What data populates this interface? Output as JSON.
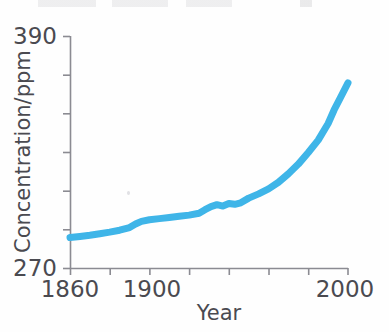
{
  "figure": {
    "background_color": "#fefefe",
    "axis_color": "#8b8b92",
    "text_color": "#4a4a50",
    "top_caption_cut_off": ""
  },
  "axes": {
    "y": {
      "title": "Concentration/ppm",
      "min_label": "270",
      "max_label": "390"
    },
    "x": {
      "title": "Year",
      "start_label": "1860",
      "mid_label": "1900",
      "end_label": "2000"
    }
  },
  "chart_data": {
    "type": "line",
    "title": "",
    "xlabel": "Year",
    "ylabel": "Concentration/ppm",
    "xlim": [
      1860,
      2000
    ],
    "ylim": [
      270,
      390
    ],
    "grid": false,
    "legend": null,
    "line_color": "#3fb5e8",
    "line_width_px": 7,
    "x_ticks": [
      1860,
      1880,
      1900,
      1920,
      1940,
      1960,
      1980,
      2000
    ],
    "x_tick_labels": [
      "1860",
      "",
      "1900",
      "",
      "",
      "",
      "",
      "2000"
    ],
    "y_ticks": [
      270,
      290,
      310,
      330,
      350,
      370,
      390
    ],
    "y_tick_labels": [
      "270",
      "",
      "",
      "",
      "",
      "",
      "390"
    ],
    "series": [
      {
        "name": "Atmospheric CO2 concentration",
        "x": [
          1860,
          1865,
          1870,
          1875,
          1880,
          1885,
          1890,
          1893,
          1896,
          1900,
          1905,
          1910,
          1915,
          1920,
          1925,
          1928,
          1931,
          1934,
          1937,
          1940,
          1943,
          1946,
          1950,
          1955,
          1960,
          1965,
          1970,
          1975,
          1980,
          1985,
          1990,
          1993,
          1996,
          2000
        ],
        "y": [
          286.0,
          286.6,
          287.2,
          288.0,
          288.8,
          289.8,
          291.2,
          293.0,
          294.4,
          295.2,
          295.8,
          296.4,
          297.0,
          297.6,
          298.6,
          300.4,
          302.0,
          303.0,
          302.3,
          303.6,
          303.2,
          304.0,
          306.4,
          308.6,
          311.2,
          314.6,
          319.0,
          324.0,
          330.0,
          336.4,
          345.0,
          352.0,
          358.0,
          366.0
        ]
      }
    ]
  }
}
